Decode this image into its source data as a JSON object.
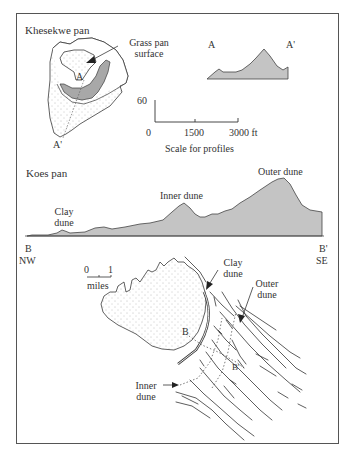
{
  "colors": {
    "profile_fill": "#c4c4c4",
    "grass_fill": "#a8a8a8",
    "line": "#3a3a3a",
    "frame": "#555555"
  },
  "khesekwe": {
    "title": "Khesekwe pan",
    "callout": "Grass pan surface",
    "callout_line1": "Grass pan",
    "callout_line2": "surface",
    "point_a": "A",
    "point_a_prime": "A'"
  },
  "profile_aa": {
    "start_label": "A",
    "end_label": "A'"
  },
  "scale": {
    "vertical_label": "60",
    "tick_0": "0",
    "tick_1500": "1500",
    "tick_3000": "3000 ft",
    "caption": "Scale for profiles"
  },
  "koes": {
    "title": "Koes pan",
    "clay_dune_line1": "Clay",
    "clay_dune_line2": "dune",
    "inner_dune": "Inner dune",
    "outer_dune": "Outer dune",
    "start_label": "B",
    "start_dir": "NW",
    "end_label": "B'",
    "end_dir": "SE"
  },
  "map": {
    "scale_0": "0",
    "scale_1": "1",
    "scale_unit": "miles",
    "clay_dune_line1": "Clay",
    "clay_dune_line2": "dune",
    "outer_dune_line1": "Outer",
    "outer_dune_line2": "dune",
    "inner_dune_line1": "Inner",
    "inner_dune_line2": "dune",
    "point_b": "B",
    "point_b_prime": "B'"
  }
}
